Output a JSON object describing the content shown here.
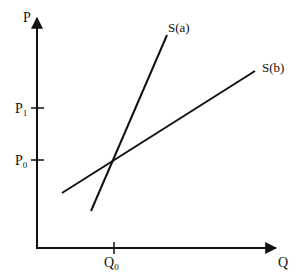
{
  "diagram": {
    "type": "supply-elasticity-diagram",
    "axes": {
      "y_label": "P",
      "x_label": "Q"
    },
    "ticks": {
      "p1": {
        "base": "P",
        "sub": "1"
      },
      "p0": {
        "base": "P",
        "sub": "0"
      },
      "q0": {
        "base": "Q",
        "sub": "0"
      }
    },
    "curves": [
      {
        "name": "S(a)",
        "label": "S(a)",
        "description": "steeper supply curve"
      },
      {
        "name": "S(b)",
        "label": "S(b)",
        "description": "flatter supply curve"
      }
    ],
    "intersection": {
      "price": "P0",
      "quantity": "Q0"
    },
    "colors": {
      "line": "#111111",
      "background": "#ffffff"
    }
  }
}
